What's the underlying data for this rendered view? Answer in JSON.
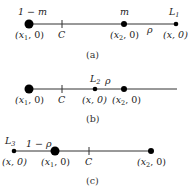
{
  "panels": [
    {
      "id": "a",
      "caption": "(a)",
      "top_labels": {
        "mass1": "1 − m",
        "mass2": "m",
        "lagrange": "L",
        "lagrange_sub": "1",
        "rho": "ρ"
      },
      "bottom_labels": {
        "x1": "(x",
        "x1_sub": "1",
        "x1_rest": ", 0)",
        "c": "C",
        "x2": "(x",
        "x2_sub": "2",
        "x2_rest": ", 0)",
        "x": "(x, 0)"
      }
    },
    {
      "id": "b",
      "caption": "(b)",
      "top_labels": {
        "lagrange": "L",
        "lagrange_sub": "2",
        "rho": "ρ"
      },
      "bottom_labels": {
        "x1": "(x",
        "x1_sub": "1",
        "x1_rest": ", 0)",
        "c": "C",
        "x": "(x, 0)",
        "x2": "(x",
        "x2_sub": "2",
        "x2_rest": ", 0)"
      }
    },
    {
      "id": "c",
      "caption": "(c)",
      "top_labels": {
        "lagrange": "L",
        "lagrange_sub": "3",
        "one_minus_rho": "1 − ρ"
      },
      "bottom_labels": {
        "x": "(x, 0)",
        "x1": "(x",
        "x1_sub": "1",
        "x1_rest": ", 0)",
        "c": "C",
        "x2": "(x",
        "x2_sub": "2",
        "x2_rest": ", 0)"
      }
    }
  ]
}
